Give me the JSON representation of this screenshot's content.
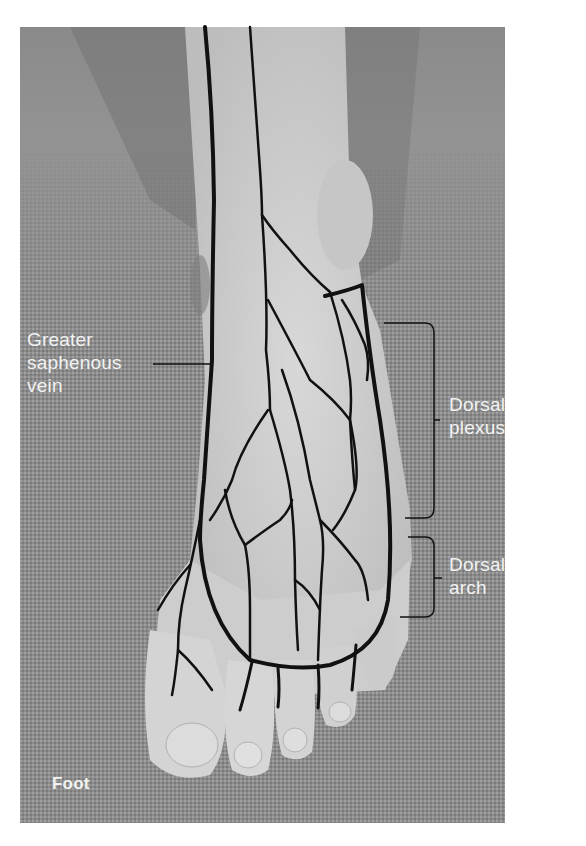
{
  "figure": {
    "subject": "Foot",
    "corner_label": "Foot",
    "background_color": "#ffffff",
    "photo_bounds": {
      "x": 20,
      "y": 27,
      "width": 485,
      "height": 796
    },
    "vein_color": "#111111",
    "label_color": "#f2f2f2"
  },
  "labels": {
    "greater_saphenous": {
      "line1": "Greater",
      "line2": "saphenous",
      "line3": "vein"
    },
    "dorsal_plexus": {
      "line1": "Dorsal",
      "line2": "plexus"
    },
    "dorsal_arch": {
      "line1": "Dorsal",
      "line2": "arch"
    }
  }
}
